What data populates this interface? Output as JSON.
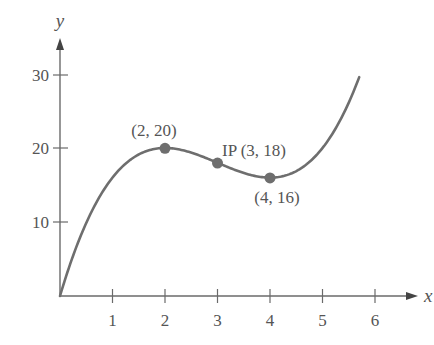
{
  "chart_data": {
    "type": "line",
    "title": "",
    "xlabel": "x",
    "ylabel": "y",
    "xlim": [
      0,
      6.8
    ],
    "ylim": [
      0,
      34
    ],
    "x_ticks": [
      1,
      2,
      3,
      4,
      5,
      6
    ],
    "y_ticks": [
      10,
      20,
      30
    ],
    "grid": false,
    "legend": null,
    "function": "f(x) = x^3 - 9x^2 + 24x",
    "domain": [
      0,
      5.7
    ],
    "series": [
      {
        "name": "f(x)",
        "x": [
          0,
          0.5,
          1,
          1.5,
          2,
          2.5,
          3,
          3.5,
          4,
          4.5,
          5,
          5.5,
          5.7
        ],
        "values": [
          0,
          9.875,
          16,
          18.875,
          20,
          18.875,
          18,
          17.125,
          16,
          16.875,
          20,
          26.125,
          29.6
        ]
      }
    ],
    "annotations": [
      {
        "label": "(2, 20)",
        "x": 2,
        "y": 20,
        "type": "local maximum"
      },
      {
        "label": "IP (3, 18)",
        "x": 3,
        "y": 18,
        "type": "inflection point"
      },
      {
        "label": "(4, 16)",
        "x": 4,
        "y": 16,
        "type": "local minimum"
      }
    ]
  },
  "labels": {
    "x_axis": "x",
    "y_axis": "y",
    "x_ticks": [
      "1",
      "2",
      "3",
      "4",
      "5",
      "6"
    ],
    "y_ticks": [
      "10",
      "20",
      "30"
    ],
    "point_max": "(2, 20)",
    "point_ip": "IP (3, 18)",
    "point_min": "(4, 16)"
  },
  "colors": {
    "curve": "#6e6e6e",
    "axis": "#6a6a6a",
    "point": "#6e6e6e",
    "text": "#555555"
  }
}
